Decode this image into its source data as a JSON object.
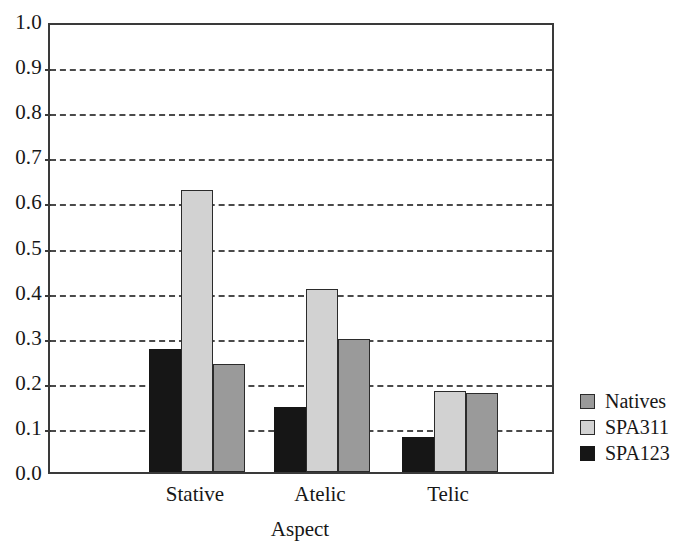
{
  "chart_data": {
    "type": "bar",
    "title": "",
    "subtitle": "",
    "xlabel": "Aspect",
    "ylabel": "",
    "categories": [
      "Stative",
      "Atelic",
      "Telic"
    ],
    "series": [
      {
        "name": "Natives",
        "color": "#9a9a9a",
        "values": [
          0.24,
          0.295,
          0.175
        ]
      },
      {
        "name": "SPA311",
        "color": "#d2d2d2",
        "values": [
          0.625,
          0.405,
          0.18
        ]
      },
      {
        "name": "SPA123",
        "color": "#161616",
        "values": [
          0.272,
          0.145,
          0.078
        ]
      }
    ],
    "series_draw_order": [
      "SPA123",
      "SPA311",
      "Natives"
    ],
    "ylim": [
      0.0,
      1.0
    ],
    "ytick_labels": [
      "0.0",
      "0.1",
      "0.2",
      "0.3",
      "0.4",
      "0.5",
      "0.6",
      "0.7",
      "0.8",
      "0.9",
      "1.0"
    ],
    "ytick_values": [
      0.0,
      0.1,
      0.2,
      0.3,
      0.4,
      0.5,
      0.6,
      0.7,
      0.8,
      0.9,
      1.0
    ],
    "grid": true,
    "grid_style": "dashed",
    "grid_axis": "y",
    "legend_position": "right",
    "legend_entries": [
      "Natives",
      "SPA311",
      "SPA123"
    ],
    "plot_border_color": "#3a3a3a",
    "background_color": "#ffffff"
  },
  "axis": {
    "x_title": "Aspect"
  },
  "ytick": {
    "labels": [
      "1.0",
      "0.9",
      "0.8",
      "0.7",
      "0.6",
      "0.5",
      "0.4",
      "0.3",
      "0.2",
      "0.1",
      "0.0"
    ]
  },
  "legend": {
    "items": [
      {
        "label": "Natives"
      },
      {
        "label": "SPA311"
      },
      {
        "label": "SPA123"
      }
    ]
  }
}
